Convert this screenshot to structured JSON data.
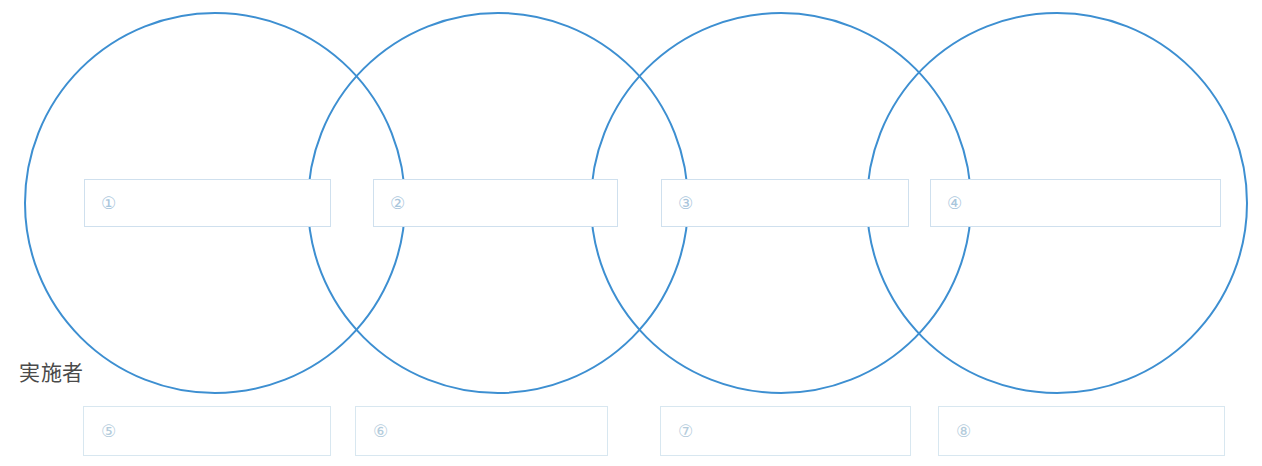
{
  "diagram": {
    "title_label": "実施者",
    "colors": {
      "circle_stroke": "#3d8fd1",
      "box_border": "#cfe0ee",
      "box_border_lower": "#d8e7f0",
      "number_text": "#a9c6dc",
      "label_text": "#4a4a4a",
      "background": "#ffffff"
    },
    "circles": [
      {
        "name": "circle-1",
        "cx": 215,
        "cy": 203,
        "r": 190
      },
      {
        "name": "circle-2",
        "cx": 498,
        "cy": 203,
        "r": 190
      },
      {
        "name": "circle-3",
        "cx": 781,
        "cy": 203,
        "r": 190
      },
      {
        "name": "circle-4",
        "cx": 1057,
        "cy": 203,
        "r": 190
      }
    ],
    "phase_boxes": [
      {
        "number": "①",
        "text": "",
        "x": 84,
        "y": 179,
        "w": 247,
        "h": 48
      },
      {
        "number": "②",
        "text": "",
        "x": 373,
        "y": 179,
        "w": 245,
        "h": 48
      },
      {
        "number": "③",
        "text": "",
        "x": 661,
        "y": 179,
        "w": 248,
        "h": 48
      },
      {
        "number": "④",
        "text": "",
        "x": 930,
        "y": 179,
        "w": 291,
        "h": 48
      }
    ],
    "actor_boxes": [
      {
        "number": "⑤",
        "text": "",
        "x": 83,
        "y": 406,
        "w": 248,
        "h": 50
      },
      {
        "number": "⑥",
        "text": "",
        "x": 355,
        "y": 406,
        "w": 253,
        "h": 50
      },
      {
        "number": "⑦",
        "text": "",
        "x": 660,
        "y": 406,
        "w": 251,
        "h": 50
      },
      {
        "number": "⑧",
        "text": "",
        "x": 938,
        "y": 406,
        "w": 287,
        "h": 50
      }
    ]
  }
}
